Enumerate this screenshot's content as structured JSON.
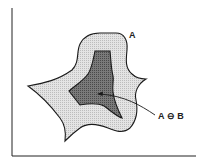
{
  "diagram": {
    "labels": {
      "outer_set": "A",
      "eroded_set": "A ⊖ B"
    },
    "colors": {
      "outer_fill": "#dcdcdc",
      "inner_fill": "#6e6e6e",
      "stroke": "#1a1a1a",
      "background": "#ffffff"
    }
  }
}
